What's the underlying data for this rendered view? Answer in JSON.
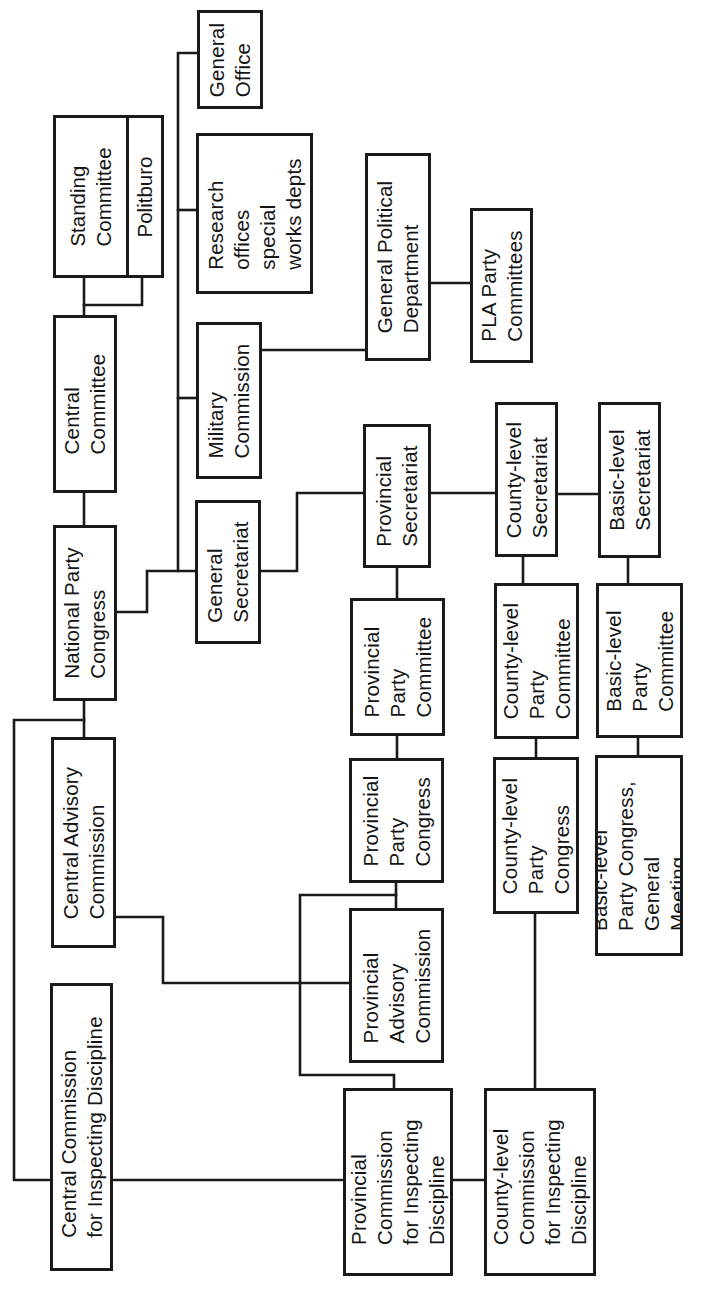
{
  "diagram": {
    "orientation": "rotated-90-ccw",
    "nodes": {
      "standing_committee": "Standing\nCommittee",
      "politburo": "Politburo",
      "central_committee": "Central\nCommittee",
      "national_party_congress": "National Party\nCongress",
      "general_office": "General\nOffice",
      "research_offices": "Research\noffices\nspecial\nworks depts",
      "military_commission": "Military\nCommission",
      "general_political_department": "General Political\nDepartment",
      "pla_party_committees": "PLA Party\nCommittees",
      "general_secretariat": "General\nSecretariat",
      "provincial_secretariat": "Provincial\nSecretariat",
      "county_secretariat": "County-level\nSecretariat",
      "basic_secretariat": "Basic-level\nSecretariat",
      "provincial_party_committee": "Provincial\nParty\nCommittee",
      "county_party_committee": "County-level\nParty\nCommittee",
      "basic_party_committee": "Basic-level\nParty\nCommittee",
      "central_advisory_commission": "Central Advisory\nCommission",
      "provincial_party_congress": "Provincial\nParty\nCongress",
      "county_party_congress": "County-level\nParty\nCongress",
      "basic_party_congress": "Basic-level\nParty Congress,\nGeneral\nMeeting",
      "provincial_advisory_commission": "Provincial\nAdvisory\nCommission",
      "central_cid": "Central Commission\nfor Inspecting Discipline",
      "provincial_cid": "Provincial\nCommission\nfor Inspecting\nDiscipline",
      "county_cid": "County-level\nCommission\nfor Inspecting\nDiscipline"
    },
    "edges": [
      [
        "national_party_congress",
        "central_committee"
      ],
      [
        "central_committee",
        "standing_committee"
      ],
      [
        "central_committee",
        "politburo"
      ],
      [
        "national_party_congress",
        "general_secretariat"
      ],
      [
        "general_secretariat",
        "military_commission"
      ],
      [
        "general_secretariat",
        "research_offices"
      ],
      [
        "general_secretariat",
        "general_office"
      ],
      [
        "military_commission",
        "general_political_department"
      ],
      [
        "general_political_department",
        "pla_party_committees"
      ],
      [
        "general_secretariat",
        "provincial_secretariat"
      ],
      [
        "provincial_secretariat",
        "county_secretariat"
      ],
      [
        "county_secretariat",
        "basic_secretariat"
      ],
      [
        "provincial_secretariat",
        "provincial_party_committee"
      ],
      [
        "county_secretariat",
        "county_party_committee"
      ],
      [
        "basic_secretariat",
        "basic_party_committee"
      ],
      [
        "provincial_party_committee",
        "provincial_party_congress"
      ],
      [
        "county_party_committee",
        "county_party_congress"
      ],
      [
        "basic_party_committee",
        "basic_party_congress"
      ],
      [
        "national_party_congress",
        "central_advisory_commission"
      ],
      [
        "national_party_congress",
        "central_cid"
      ],
      [
        "central_advisory_commission",
        "provincial_advisory_commission"
      ],
      [
        "provincial_party_congress",
        "provincial_advisory_commission"
      ],
      [
        "provincial_party_congress",
        "provincial_cid"
      ],
      [
        "central_cid",
        "provincial_cid"
      ],
      [
        "provincial_cid",
        "county_cid"
      ],
      [
        "county_party_congress",
        "county_cid"
      ]
    ]
  }
}
